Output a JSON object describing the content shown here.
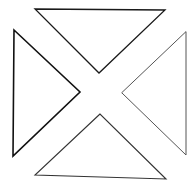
{
  "diagram": {
    "background": "#ffffff",
    "triangles": [
      {
        "name": "top-triangle",
        "points": "35,9 165,10 99,73",
        "stroke": "#1a1a1a",
        "stroke_width": 1.3
      },
      {
        "name": "left-triangle",
        "points": "14,30 13,156 80,92",
        "stroke": "#111111",
        "stroke_width": 1.6
      },
      {
        "name": "right-triangle",
        "points": "186,32 186,155 122,93",
        "stroke": "#555555",
        "stroke_width": 1.0
      },
      {
        "name": "bottom-triangle",
        "points": "100,114 35,175 166,179",
        "stroke": "#333333",
        "stroke_width": 1.1
      }
    ]
  }
}
